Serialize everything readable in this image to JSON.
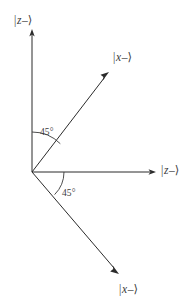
{
  "figure": {
    "type": "vector-axis-diagram",
    "background_color": "#ffffff",
    "line_color": "#2b2b2b",
    "text_color": "#3a3a3a",
    "width": 192,
    "height": 308
  },
  "origin": {
    "x": 32,
    "y": 172
  },
  "axes": [
    {
      "id": "z-up-axis",
      "name": "vertical-axis",
      "label": "|z–⟩",
      "label_parts": {
        "bar": "|",
        "var": "z",
        "sign": "–",
        "angle": "⟩"
      },
      "from": {
        "x": 32,
        "y": 172
      },
      "to": {
        "x": 32,
        "y": 30
      },
      "direction": "up",
      "arrow": true
    },
    {
      "id": "z-right-axis",
      "name": "horizontal-axis",
      "label": "|z–⟩",
      "label_parts": {
        "bar": "|",
        "var": "z",
        "sign": "–",
        "angle": "⟩"
      },
      "from": {
        "x": 32,
        "y": 172
      },
      "to": {
        "x": 155,
        "y": 172
      },
      "direction": "right",
      "arrow": true
    }
  ],
  "vectors": [
    {
      "id": "x-upper-vector",
      "name": "upper-right-diagonal",
      "label": "|x–⟩",
      "label_parts": {
        "bar": "|",
        "var": "x",
        "sign": "–",
        "angle": "⟩"
      },
      "from": {
        "x": 32,
        "y": 172
      },
      "to": {
        "x": 108,
        "y": 74
      },
      "angle_from_horizontal_deg": 45,
      "arrow": true
    },
    {
      "id": "x-lower-vector",
      "name": "lower-right-diagonal",
      "label": "|x–⟩",
      "label_parts": {
        "bar": "|",
        "var": "x",
        "sign": "–",
        "angle": "⟩"
      },
      "from": {
        "x": 32,
        "y": 172
      },
      "to": {
        "x": 118,
        "y": 272
      },
      "angle_from_horizontal_deg": -45,
      "arrow": true
    }
  ],
  "angles": [
    {
      "id": "angle-upper",
      "name": "angle-between-vertical-axis-and-upper-vector",
      "label": "45°",
      "value": 45,
      "unit": "degrees",
      "arc_radius": 40,
      "between": [
        "z-up-axis",
        "x-upper-vector"
      ]
    },
    {
      "id": "angle-lower",
      "name": "angle-between-horizontal-axis-and-lower-vector",
      "label": "45°",
      "value": 45,
      "unit": "degrees",
      "arc_radius": 32,
      "between": [
        "z-right-axis",
        "x-lower-vector"
      ]
    }
  ]
}
